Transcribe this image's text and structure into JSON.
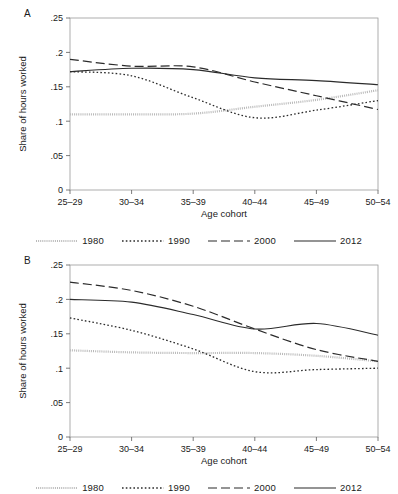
{
  "figure": {
    "panels": [
      {
        "id": "A",
        "letter": "A"
      },
      {
        "id": "B",
        "letter": "B"
      }
    ],
    "legend": {
      "entries": [
        {
          "label": "1980",
          "style": "dense-dotted-gray",
          "color": "#b9b9b9"
        },
        {
          "label": "1990",
          "style": "dotted",
          "color": "#2b2b2b"
        },
        {
          "label": "2000",
          "style": "dashed",
          "color": "#2b2b2b"
        },
        {
          "label": "2012",
          "style": "solid",
          "color": "#2b2b2b"
        }
      ]
    },
    "axis": {
      "ylabel": "Share of hours worked",
      "xlabel": "Age cohort",
      "yticks": [
        "0",
        ".05",
        ".1",
        ".15",
        ".2",
        ".25"
      ],
      "xticks": [
        "25–29",
        "30–34",
        "35–39",
        "40–44",
        "45–49",
        "50–54"
      ]
    }
  },
  "chart_data": [
    {
      "type": "line",
      "panel": "A",
      "title": "A",
      "xlabel": "Age cohort",
      "ylabel": "Share of hours worked",
      "categories": [
        "25–29",
        "30–34",
        "35–39",
        "40–44",
        "45–49",
        "50–54"
      ],
      "ylim": [
        0,
        0.25
      ],
      "yticks": [
        0,
        0.05,
        0.1,
        0.15,
        0.2,
        0.25
      ],
      "grid": false,
      "legend_position": "bottom",
      "series": [
        {
          "name": "1980",
          "values": [
            0.11,
            0.11,
            0.111,
            0.121,
            0.131,
            0.145
          ],
          "color": "#b9b9b9",
          "style": "dense-dotted-gray"
        },
        {
          "name": "1990",
          "values": [
            0.172,
            0.166,
            0.134,
            0.105,
            0.116,
            0.13
          ],
          "color": "#2b2b2b",
          "style": "dotted"
        },
        {
          "name": "2000",
          "values": [
            0.19,
            0.18,
            0.179,
            0.157,
            0.137,
            0.117
          ],
          "color": "#2b2b2b",
          "style": "dashed"
        },
        {
          "name": "2012",
          "values": [
            0.172,
            0.177,
            0.175,
            0.163,
            0.159,
            0.153
          ],
          "color": "#2b2b2b",
          "style": "solid"
        }
      ]
    },
    {
      "type": "line",
      "panel": "B",
      "title": "B",
      "xlabel": "Age cohort",
      "ylabel": "Share of hours worked",
      "categories": [
        "25–29",
        "30–34",
        "35–39",
        "40–44",
        "45–49",
        "50–54"
      ],
      "ylim": [
        0,
        0.25
      ],
      "yticks": [
        0,
        0.05,
        0.1,
        0.15,
        0.2,
        0.25
      ],
      "grid": false,
      "legend_position": "bottom",
      "series": [
        {
          "name": "1980",
          "values": [
            0.126,
            0.123,
            0.122,
            0.122,
            0.118,
            0.11
          ],
          "color": "#b9b9b9",
          "style": "dense-dotted-gray"
        },
        {
          "name": "1990",
          "values": [
            0.173,
            0.155,
            0.128,
            0.095,
            0.098,
            0.1
          ],
          "color": "#2b2b2b",
          "style": "dotted"
        },
        {
          "name": "2000",
          "values": [
            0.225,
            0.213,
            0.19,
            0.157,
            0.127,
            0.11
          ],
          "color": "#2b2b2b",
          "style": "dashed"
        },
        {
          "name": "2012",
          "values": [
            0.2,
            0.196,
            0.178,
            0.157,
            0.165,
            0.148
          ],
          "color": "#2b2b2b",
          "style": "solid"
        }
      ]
    }
  ]
}
